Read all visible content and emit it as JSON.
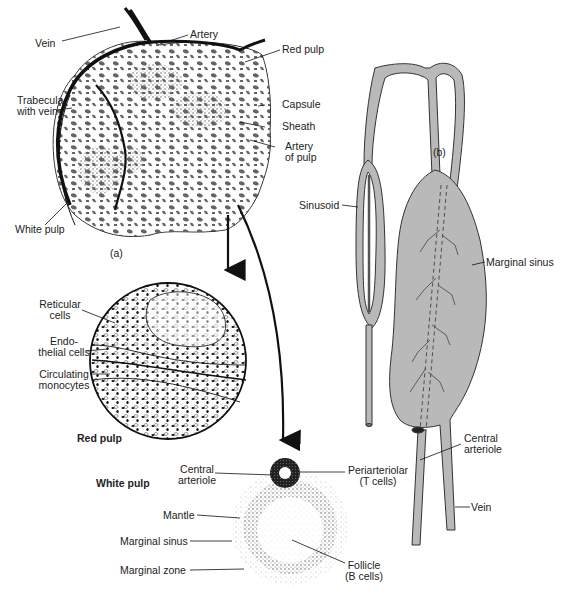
{
  "figure": {
    "panel_a": {
      "tag": "(a)",
      "labels": {
        "vein": "Vein",
        "artery": "Artery",
        "red_pulp": "Red pulp",
        "trabecula_1": "Trabecula",
        "trabecula_2": "with vein",
        "capsule": "Capsule",
        "sheath": "Sheath",
        "artery_of_pulp_1": "Artery",
        "artery_of_pulp_2": "of pulp",
        "white_pulp": "White pulp"
      }
    },
    "red_pulp_detail": {
      "title": "Red pulp",
      "labels": {
        "reticular_1": "Reticular",
        "reticular_2": "cells",
        "endothelial_1": "Endo-",
        "endothelial_2": "thelial cells",
        "monocytes_1": "Circulating",
        "monocytes_2": "monocytes"
      }
    },
    "white_pulp_detail": {
      "title": "White pulp",
      "labels": {
        "central_arteriole_1": "Central",
        "central_arteriole_2": "arteriole",
        "periarteriolar_1": "Periarteriolar",
        "periarteriolar_2": "(T cells)",
        "mantle": "Mantle",
        "marginal_sinus": "Marginal sinus",
        "marginal_zone": "Marginal zone",
        "follicle_1": "Follicle",
        "follicle_2": "(B cells)"
      }
    },
    "panel_b": {
      "tag": "(b)",
      "labels": {
        "sinusoid": "Sinusoid",
        "marginal_sinus": "Marginal sinus",
        "central_arteriole_1": "Central",
        "central_arteriole_2": "arteriole",
        "vein": "Vein"
      }
    },
    "colors": {
      "ink": "#111111",
      "vessel_grey": "#b9b9b9",
      "stipple": "#9a9a9a"
    }
  }
}
